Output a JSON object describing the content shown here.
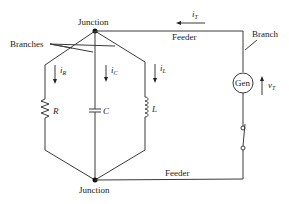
{
  "diagram": {
    "type": "parallel RLC circuit with generator",
    "labels": {
      "junction_top": "Junction",
      "junction_bottom": "Junction",
      "branches": "Branches",
      "feeder_top": "Feeder",
      "feeder_bottom": "Feeder",
      "branch_right": "Branch",
      "generator": "Gen"
    },
    "components": {
      "resistor": "R",
      "capacitor": "C",
      "inductor": "L"
    },
    "currents": {
      "i_R": {
        "main": "i",
        "sub": "R"
      },
      "i_C": {
        "main": "i",
        "sub": "C"
      },
      "i_L": {
        "main": "i",
        "sub": "L"
      },
      "i_T": {
        "main": "i",
        "sub": "T"
      }
    },
    "voltage": {
      "v_T": {
        "main": "v",
        "sub": "T"
      }
    },
    "colors": {
      "wire": "#3a3a3a",
      "text": "#222222",
      "background": "#ffffff"
    }
  }
}
